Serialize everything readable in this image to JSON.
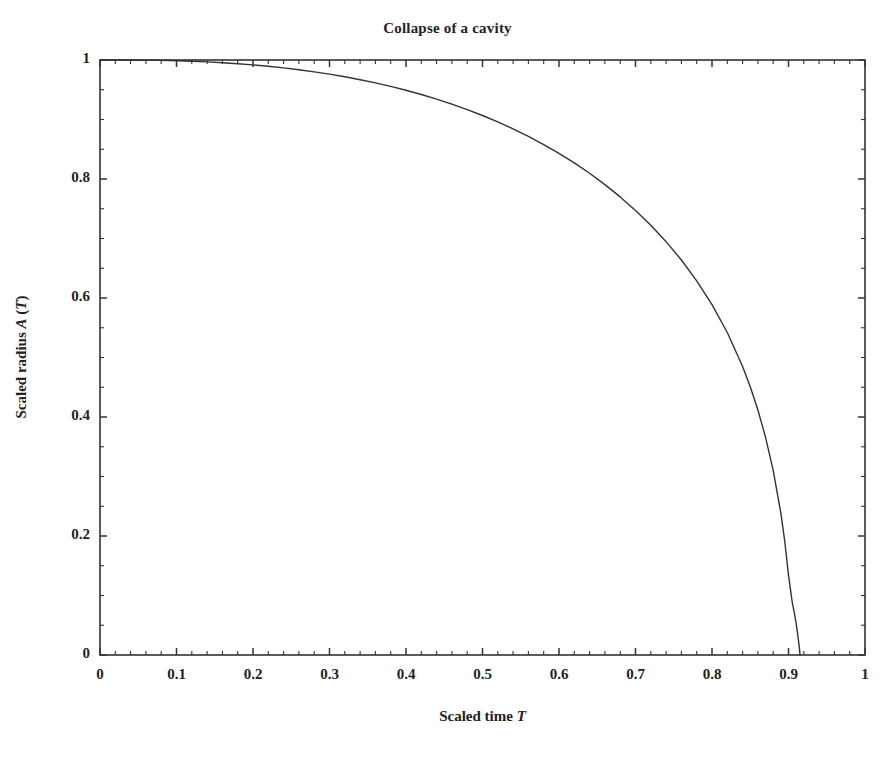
{
  "chart_data": {
    "type": "line",
    "title": "Collapse of a cavity",
    "xlabel_plain": "Scaled time ",
    "xlabel_symbol": "T",
    "ylabel_plain_a": "Scaled radius ",
    "ylabel_symbol_a": "A",
    "ylabel_plain_b": " (",
    "ylabel_symbol_b": "T",
    "ylabel_plain_c": ")",
    "xlabel": "Scaled time T",
    "ylabel": "Scaled radius A (T)",
    "xlim": [
      0,
      1
    ],
    "ylim": [
      0,
      1
    ],
    "xticks": [
      0,
      0.1,
      0.2,
      0.3,
      0.4,
      0.5,
      0.6,
      0.7,
      0.8,
      0.9,
      1
    ],
    "xtick_labels": [
      "0",
      "0.1",
      "0.2",
      "0.3",
      "0.4",
      "0.5",
      "0.6",
      "0.7",
      "0.8",
      "0.9",
      "1"
    ],
    "yticks": [
      0,
      0.2,
      0.4,
      0.6,
      0.8,
      1
    ],
    "ytick_labels": [
      "0",
      "0.2",
      "0.4",
      "0.6",
      "0.8",
      "1"
    ],
    "x_minor_step": 0.02,
    "y_minor_step": 0.05,
    "grid": false,
    "legend": null,
    "line_color": "#333333",
    "line_width": 1.4,
    "frame_color": "#333333",
    "background": "#ffffff",
    "collapse_time": 0.915,
    "series": [
      {
        "name": "Scaled radius A (T)",
        "x": [
          0.0,
          0.02,
          0.04,
          0.06,
          0.08,
          0.1,
          0.12,
          0.14,
          0.16,
          0.18,
          0.2,
          0.22,
          0.24,
          0.26,
          0.28,
          0.3,
          0.32,
          0.34,
          0.36,
          0.38,
          0.4,
          0.42,
          0.44,
          0.46,
          0.48,
          0.5,
          0.52,
          0.54,
          0.56,
          0.58,
          0.6,
          0.62,
          0.64,
          0.66,
          0.68,
          0.7,
          0.72,
          0.74,
          0.76,
          0.78,
          0.8,
          0.82,
          0.84,
          0.85,
          0.86,
          0.87,
          0.88,
          0.89,
          0.895,
          0.9,
          0.905,
          0.908,
          0.91,
          0.912,
          0.9135,
          0.9145,
          0.915
        ],
        "y": [
          1.0,
          1.0,
          0.9999,
          0.9997,
          0.9993,
          0.9987,
          0.9979,
          0.9968,
          0.9954,
          0.9938,
          0.9918,
          0.9894,
          0.9867,
          0.9836,
          0.9801,
          0.9762,
          0.9718,
          0.9669,
          0.9615,
          0.9556,
          0.9491,
          0.942,
          0.9342,
          0.9258,
          0.9166,
          0.9067,
          0.8959,
          0.8842,
          0.8716,
          0.8579,
          0.8431,
          0.8271,
          0.8096,
          0.7906,
          0.7699,
          0.7472,
          0.7223,
          0.6947,
          0.6638,
          0.6289,
          0.5889,
          0.542,
          0.4849,
          0.4509,
          0.4118,
          0.3659,
          0.3102,
          0.2384,
          0.1923,
          0.1341,
          0.0876,
          0.0684,
          0.0531,
          0.0346,
          0.0195,
          0.0086,
          0.0
        ]
      }
    ]
  }
}
